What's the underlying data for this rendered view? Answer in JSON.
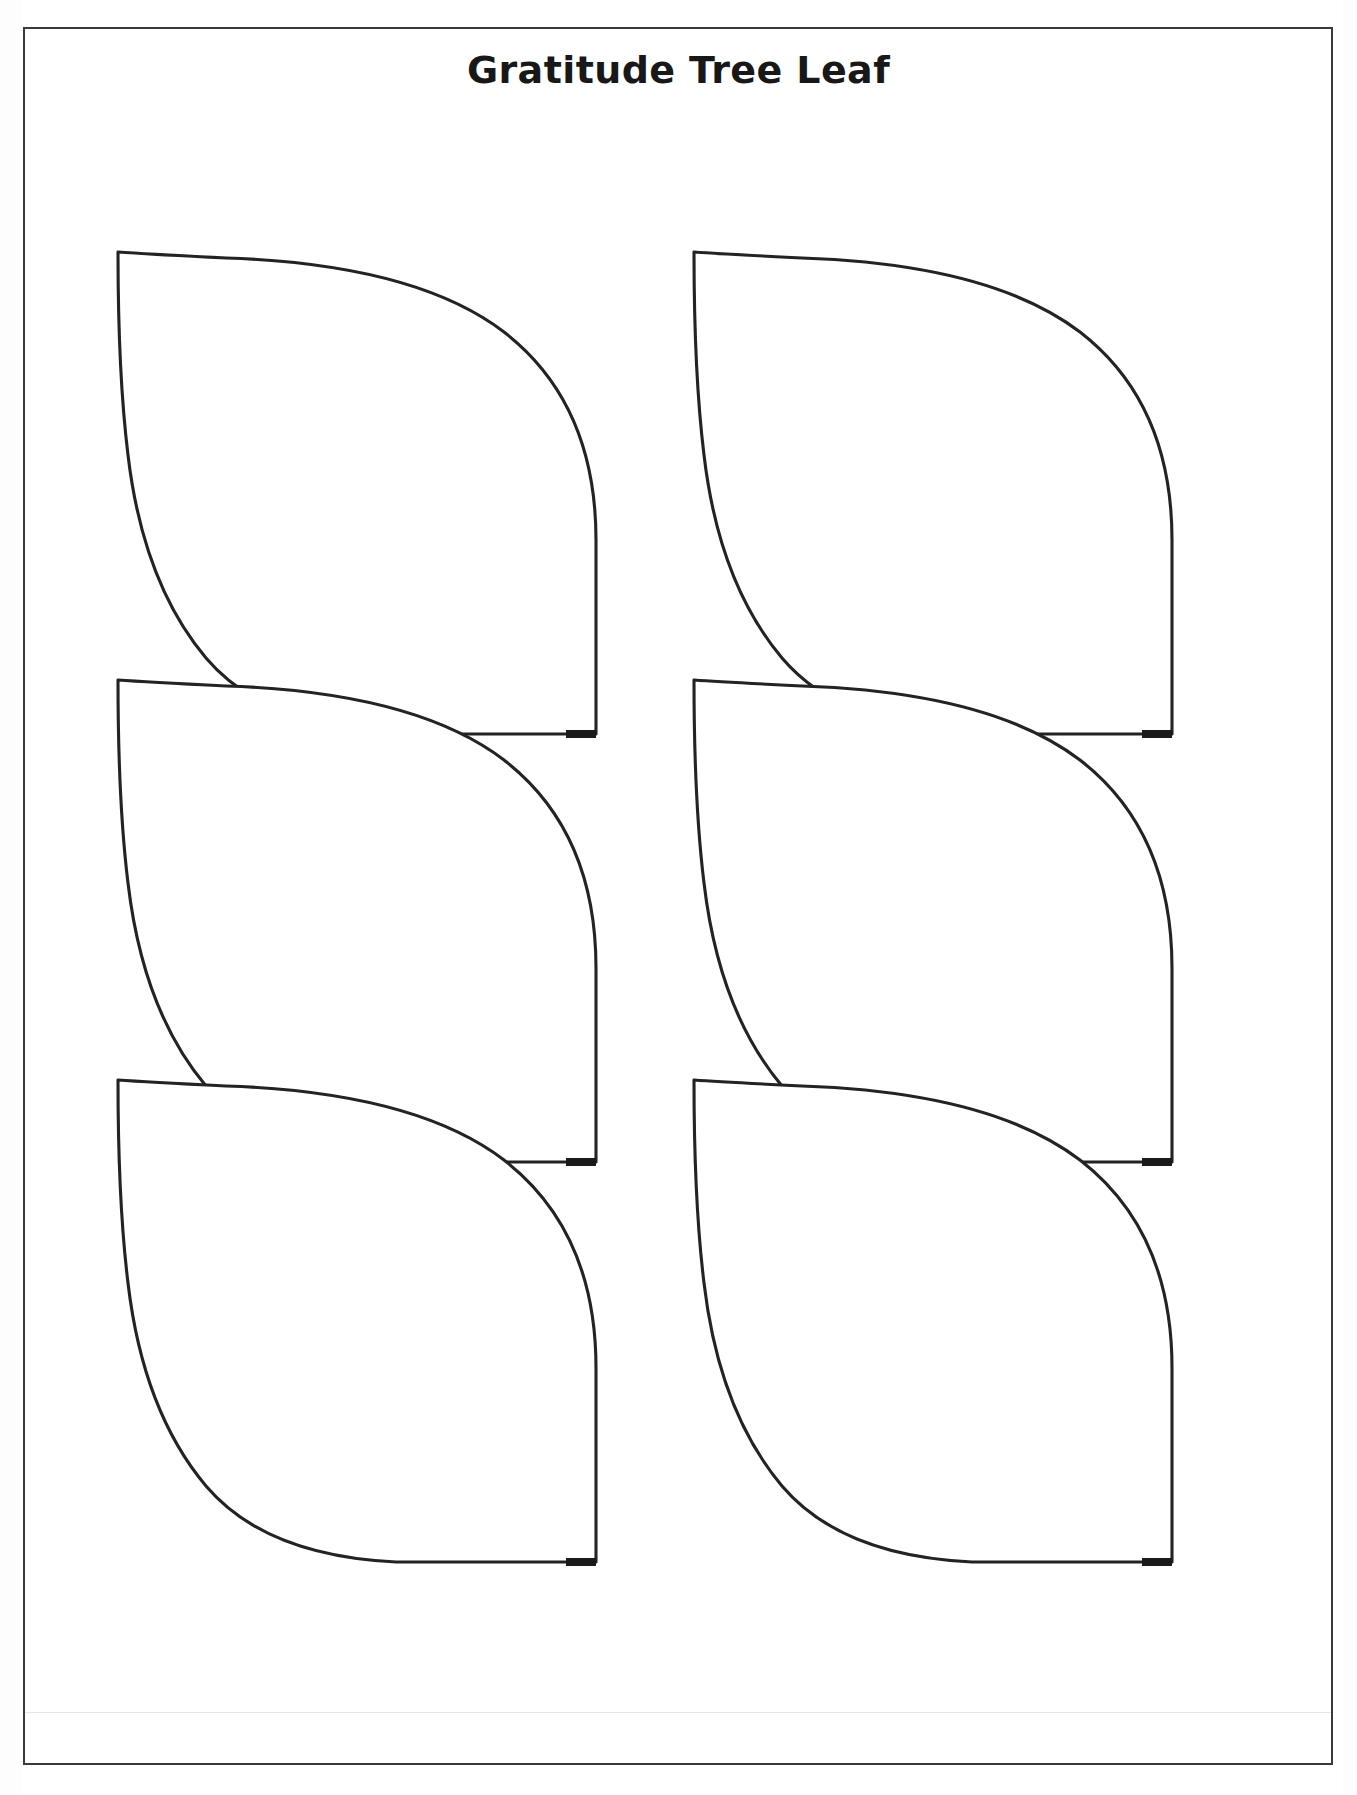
{
  "document": {
    "title": "Gratitude Tree Leaf",
    "type": "printable-template",
    "page_background": "#ffffff",
    "border_color": "#3a3a3a",
    "ink_color": "#232323"
  },
  "leaves": [
    {
      "id": "leaf-1",
      "row": 0,
      "column": 0,
      "label": "leaf-template-1"
    },
    {
      "id": "leaf-2",
      "row": 0,
      "column": 1,
      "label": "leaf-template-2"
    },
    {
      "id": "leaf-3",
      "row": 1,
      "column": 0,
      "label": "leaf-template-3"
    },
    {
      "id": "leaf-4",
      "row": 1,
      "column": 1,
      "label": "leaf-template-4"
    },
    {
      "id": "leaf-5",
      "row": 2,
      "column": 0,
      "label": "leaf-template-5"
    },
    {
      "id": "leaf-6",
      "row": 2,
      "column": 1,
      "label": "leaf-template-6"
    }
  ],
  "layout": {
    "rows": 3,
    "columns": 2,
    "total_leaves": 6
  }
}
